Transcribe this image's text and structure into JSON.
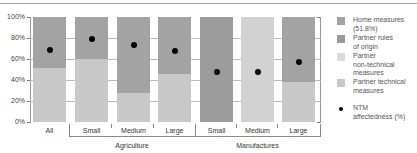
{
  "chart_data": {
    "type": "bar",
    "stacked": true,
    "title": "",
    "xlabel": "",
    "ylabel": "",
    "ylim": [
      0,
      100
    ],
    "yticks": [
      "0%",
      "20%",
      "40%",
      "60%",
      "80%",
      "100%"
    ],
    "categories": [
      "All",
      "Small",
      "Medium",
      "Large",
      "Small",
      "Medium",
      "Large"
    ],
    "groups": [
      {
        "label": "Agriculture",
        "categories": [
          "Small",
          "Medium",
          "Large"
        ]
      },
      {
        "label": "Manufactures",
        "categories": [
          "Small",
          "Medium",
          "Large"
        ]
      }
    ],
    "series": [
      {
        "name": "Partner technical measures",
        "color": "#c8c8c8",
        "values": [
          51,
          60,
          28,
          46,
          0,
          0,
          38
        ]
      },
      {
        "name": "Partner non-technical measures",
        "color": "#d2d2d2",
        "values": [
          0,
          0,
          0,
          0,
          0,
          100,
          0
        ]
      },
      {
        "name": "Partner rules of origin",
        "color": "#9c9c9c",
        "values": [
          0,
          0,
          0,
          0,
          100,
          0,
          0
        ]
      },
      {
        "name": "Home measures (51.8%)",
        "color": "#a3a3a3",
        "values": [
          49,
          40,
          72,
          54,
          0,
          0,
          62
        ]
      }
    ],
    "markers": {
      "name": "NTM affectedness (%)",
      "color": "#000000",
      "values": [
        69,
        79,
        73,
        68,
        48,
        48,
        57
      ]
    },
    "grid": true,
    "legend_position": "right"
  },
  "legend": {
    "items": [
      {
        "label": "Home measures\n(51.8%)",
        "color": "#a3a3a3",
        "kind": "swatch"
      },
      {
        "label": "Partner rules\nof origin",
        "color": "#9c9c9c",
        "kind": "swatch"
      },
      {
        "label": "Partner\nnon-technical\nmeasures",
        "color": "#dcdcdc",
        "kind": "swatch"
      },
      {
        "label": "Partner technical\nmeasures",
        "color": "#c8c8c8",
        "kind": "swatch"
      },
      {
        "label": "NTM\naffectedness (%)",
        "color": "#000000",
        "kind": "dot"
      }
    ]
  },
  "axis": {
    "y_labels": [
      "100%",
      "80%",
      "60%",
      "40%",
      "20%",
      "0%"
    ],
    "x_labels": [
      "All",
      "Small",
      "Medium",
      "Large",
      "Small",
      "Medium",
      "Large"
    ],
    "group_labels": [
      "Agriculture",
      "Manufactures"
    ]
  }
}
